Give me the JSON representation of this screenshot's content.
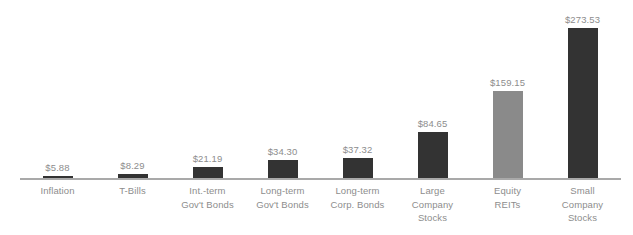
{
  "chart_data": {
    "type": "bar",
    "title": "",
    "subtitle": "",
    "xlabel": "",
    "ylabel": "",
    "grid": false,
    "legend": "none",
    "ylim": [
      0,
      300
    ],
    "categories": [
      "Inflation",
      "Int.-term Gov't Bonds",
      "Long-term Gov't Bonds",
      "Long-term Corp. Bonds",
      "Large Company Stocks",
      "Equity REITs",
      "Small Company Stocks",
      "T-Bills"
    ],
    "values": [
      5.88,
      8.29,
      21.19,
      34.3,
      37.32,
      84.65,
      159.15,
      273.53
    ],
    "value_labels": [
      "$5.88",
      "$8.29",
      "$21.19",
      "$34.30",
      "$37.32",
      "$84.65",
      "$159.15",
      "$273.53"
    ],
    "series": [
      {
        "name": "Ending wealth of $1 invested",
        "values": [
          5.88,
          8.29,
          21.19,
          34.3,
          37.32,
          84.65,
          159.15,
          273.53
        ]
      }
    ],
    "colors": {
      "bar_dark": "#333333",
      "bar_light": "#8a8a8a",
      "axis": "#a9a9a9",
      "label_text": "#8d8d8d",
      "background": "#ffffff"
    }
  },
  "bars": [
    {
      "label_lines": [
        "Inflation"
      ],
      "value_label": "$5.88",
      "value": 5.88,
      "color_key": "bar_dark"
    },
    {
      "label_lines": [
        "T-Bills"
      ],
      "value_label": "$8.29",
      "value": 8.29,
      "color_key": "bar_dark"
    },
    {
      "label_lines": [
        "Int.-term",
        "Gov't Bonds"
      ],
      "value_label": "$21.19",
      "value": 21.19,
      "color_key": "bar_dark"
    },
    {
      "label_lines": [
        "Long-term",
        "Gov't Bonds"
      ],
      "value_label": "$34.30",
      "value": 34.3,
      "color_key": "bar_dark"
    },
    {
      "label_lines": [
        "Long-term",
        "Corp. Bonds"
      ],
      "value_label": "$37.32",
      "value": 37.32,
      "color_key": "bar_dark"
    },
    {
      "label_lines": [
        "Large",
        "Company",
        "Stocks"
      ],
      "value_label": "$84.65",
      "value": 84.65,
      "color_key": "bar_dark"
    },
    {
      "label_lines": [
        "Equity",
        "REITs"
      ],
      "value_label": "$159.15",
      "value": 159.15,
      "color_key": "bar_light"
    },
    {
      "label_lines": [
        "Small",
        "Company",
        "Stocks"
      ],
      "value_label": "$273.53",
      "value": 273.53,
      "color_key": "bar_dark"
    }
  ]
}
